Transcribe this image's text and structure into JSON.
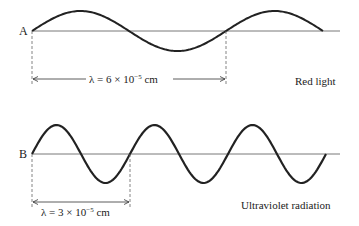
{
  "diagram": {
    "panels": [
      {
        "id": "A",
        "letter": "A",
        "wavelength_label_prefix": "λ = 6 × 10",
        "wavelength_exponent": "−5",
        "wavelength_unit": " cm",
        "caption": "Red light",
        "wavelength_cm": "6 × 10^-5",
        "cycles_shown": 1.5
      },
      {
        "id": "B",
        "letter": "B",
        "wavelength_label_prefix": "λ = 3 × 10",
        "wavelength_exponent": "−5",
        "wavelength_unit": " cm",
        "caption": "Ultraviolet radiation",
        "wavelength_cm": "3 × 10^-5",
        "cycles_shown": 3
      }
    ],
    "colors": {
      "wave": "#222222",
      "axis": "#555555",
      "dashed": "#666666"
    }
  }
}
